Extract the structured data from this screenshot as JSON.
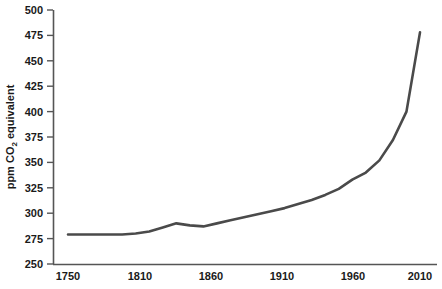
{
  "chart_data": {
    "type": "line",
    "title": "",
    "subtitle": "",
    "xlabel": "",
    "ylabel": "ppm CO2 equivalent",
    "ylabel_parts": {
      "pre": "ppm CO",
      "sub": "2",
      "post": " equivalent"
    },
    "xlim": [
      1750,
      2020
    ],
    "ylim": [
      250,
      500
    ],
    "grid": false,
    "legend": null,
    "line_color": "#4a4a4a",
    "axis_color": "#555555",
    "x_ticks": [
      1750,
      1810,
      1860,
      1910,
      1960,
      2010
    ],
    "x_tick_labels": [
      "1750",
      "1810",
      "1860",
      "1910",
      "1960",
      "2010"
    ],
    "y_ticks": [
      250,
      275,
      300,
      325,
      350,
      375,
      400,
      425,
      450,
      475,
      500
    ],
    "y_tick_labels": [
      "250",
      "275",
      "300",
      "325",
      "350",
      "375",
      "400",
      "425",
      "450",
      "475",
      "500"
    ],
    "series": [
      {
        "name": "Greenhouse gas concentration",
        "x": [
          1750,
          1760,
          1770,
          1780,
          1790,
          1800,
          1810,
          1820,
          1830,
          1840,
          1850,
          1860,
          1870,
          1880,
          1890,
          1900,
          1910,
          1920,
          1930,
          1940,
          1950,
          1960,
          1970,
          1980,
          1990,
          2000,
          2010
        ],
        "values": [
          279,
          279,
          279,
          279,
          279,
          280,
          282,
          286,
          290,
          288,
          287,
          290,
          293,
          296,
          299,
          302,
          305,
          309,
          313,
          318,
          324,
          333,
          340,
          352,
          372,
          400,
          478
        ]
      }
    ]
  }
}
